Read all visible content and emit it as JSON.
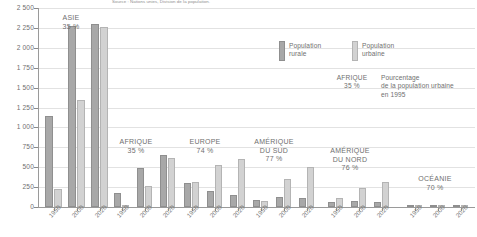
{
  "source": "Source : Nations unies, Division de la population.",
  "legend": {
    "rural_label_line1": "Population",
    "rural_label_line2": "rurale",
    "urbaine_label_line1": "Population",
    "urbaine_label_line2": "urbaine",
    "note_key_region": "AFRIQUE",
    "note_key_pct": "35 %",
    "note_line1": "Pourcentage",
    "note_line2": "de la population urbaine",
    "note_line3": "en 1995"
  },
  "colors": {
    "rural": "#a8a8a8",
    "urbaine": "#d2d2d2",
    "axis": "#9a9a9a",
    "grid": "#e2e2e2",
    "text": "#6f6f6f"
  },
  "chart_data": {
    "type": "bar",
    "title": "",
    "subtitle": "",
    "xlabel": "",
    "ylabel": "",
    "ylim": [
      0,
      2500
    ],
    "ytick_values": [
      0,
      250,
      500,
      750,
      1000,
      1250,
      1500,
      1750,
      2000,
      2250,
      2500
    ],
    "ytick_labels": [
      "0",
      "250",
      "500",
      "750",
      "1 000",
      "1 250",
      "1 500",
      "1 750",
      "2 000",
      "2 250",
      "2 500"
    ],
    "unit": "millions d'habitants",
    "grid": true,
    "legend_position": "top-right",
    "categories": [
      "1950",
      "2000",
      "2020"
    ],
    "series": [
      {
        "name": "Population rurale",
        "color": "#a8a8a8"
      },
      {
        "name": "Population urbaine",
        "color": "#d2d2d2"
      }
    ],
    "groups": [
      {
        "region": "ASIE",
        "pct_urbaine_1995": "35 %",
        "years": [
          "1950",
          "2000",
          "2020"
        ],
        "rurale": [
          1140,
          2270,
          2300
        ],
        "urbaine": [
          225,
          1340,
          2265
        ]
      },
      {
        "region": "AFRIQUE",
        "pct_urbaine_1995": "35 %",
        "years": [
          "1950",
          "2000",
          "2020"
        ],
        "rurale": [
          180,
          495,
          655
        ],
        "urbaine": [
          30,
          270,
          620
        ]
      },
      {
        "region": "EUROPE",
        "pct_urbaine_1995": "74 %",
        "years": [
          "1950",
          "2000",
          "2020"
        ],
        "rurale": [
          300,
          200,
          150
        ],
        "urbaine": [
          320,
          530,
          600
        ]
      },
      {
        "region": "AMÉRIQUE DU SUD",
        "region_line1": "AMÉRIQUE",
        "region_line2": "DU SUD",
        "pct_urbaine_1995": "77 %",
        "years": [
          "1950",
          "2000",
          "2020"
        ],
        "rurale": [
          90,
          125,
          110
        ],
        "urbaine": [
          70,
          350,
          500
        ]
      },
      {
        "region": "AMÉRIQUE DU NORD",
        "region_line1": "AMÉRIQUE",
        "region_line2": "DU NORD",
        "pct_urbaine_1995": "76 %",
        "years": [
          "1950",
          "2000",
          "2020"
        ],
        "rurale": [
          60,
          70,
          60
        ],
        "urbaine": [
          110,
          240,
          320
        ]
      },
      {
        "region": "OCÉANIE",
        "pct_urbaine_1995": "70 %",
        "years": [
          "1950",
          "2000",
          "2020"
        ],
        "rurale": [
          5,
          8,
          8
        ],
        "urbaine": [
          8,
          22,
          30
        ]
      }
    ]
  }
}
